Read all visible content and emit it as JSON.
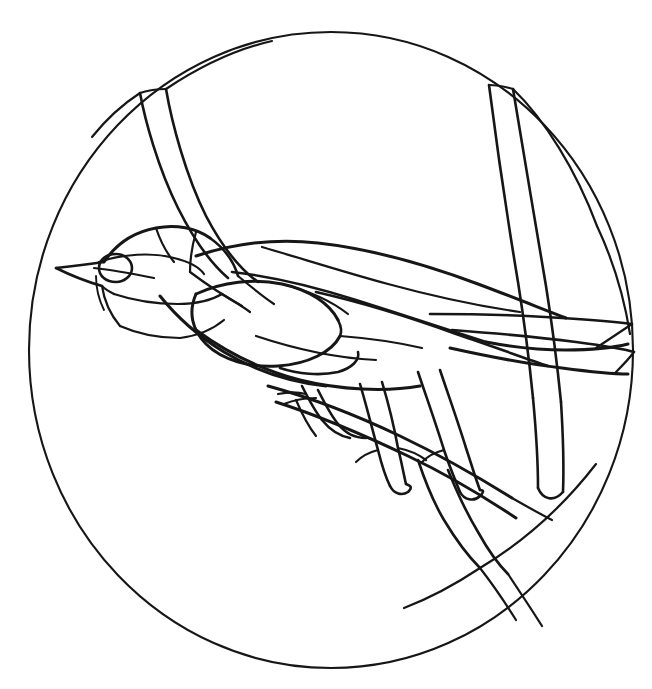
{
  "artwork": {
    "title": "Stained Glass Bird Pattern",
    "subject": "perched songbird on branch inside circular border",
    "style": "line-art / stained-glass lead-came pattern",
    "background_color": "#ffffff",
    "line_color": "#161616",
    "canvas": {
      "width": 652,
      "height": 689
    }
  },
  "frame": {
    "name": "circular-border",
    "shape": "circle",
    "center_x": 331,
    "center_y": 350,
    "radius_x": 302,
    "radius_y": 318,
    "stroke_width": 2.1
  },
  "regions": [
    {
      "name": "head",
      "label": "Head"
    },
    {
      "name": "crown",
      "label": "Crown"
    },
    {
      "name": "eye",
      "label": "Eye"
    },
    {
      "name": "beak",
      "label": "Beak"
    },
    {
      "name": "cheek",
      "label": "Cheek"
    },
    {
      "name": "throat",
      "label": "Throat"
    },
    {
      "name": "breast",
      "label": "Breast"
    },
    {
      "name": "belly",
      "label": "Belly"
    },
    {
      "name": "back",
      "label": "Back"
    },
    {
      "name": "wing-coverts",
      "label": "Wing coverts"
    },
    {
      "name": "wing-primaries",
      "label": "Wing primaries"
    },
    {
      "name": "tail",
      "label": "Tail"
    },
    {
      "name": "leg-front",
      "label": "Front leg"
    },
    {
      "name": "leg-rear",
      "label": "Rear leg"
    },
    {
      "name": "foot-toes",
      "label": "Toes"
    },
    {
      "name": "branch-main",
      "label": "Main branch"
    },
    {
      "name": "branch-upper-left",
      "label": "Upper left branch"
    },
    {
      "name": "branch-upper-right",
      "label": "Upper right branch"
    },
    {
      "name": "branch-lower",
      "label": "Lower branch"
    }
  ],
  "chart_data": {
    "type": "line",
    "xlabel": "",
    "ylabel": "",
    "paths": {
      "frame_circle": "M 331 32 C 497 32 633 174 633 350 C 633 526 497 668 331 668 C 165 668 29 526 29 350 C 29 174 165 32 331 32 Z",
      "branch_ul_edge_a": "M 140 93 C 145 120 158 168 178 208 C 196 244 214 266 228 278",
      "branch_ul_edge_b": "M 166 89 C 172 124 186 176 206 216 C 226 254 244 272 258 282",
      "branch_ul_top": "M 140 93 C 149 90 158 89 166 89",
      "branch_ul_tip_left": "M 140 93 C 120 106 104 122 92 137",
      "branch_ul_tip_right": "M 166 89 C 196 69 232 50 272 41",
      "branch_ur_edge_a": "M 489 85 C 496 140 508 222 518 282 C 525 326 530 368 533 398",
      "branch_ur_edge_b": "M 513 89 C 522 145 536 226 546 286 C 553 330 558 372 561 402",
      "branch_ur_top": "M 489 85 C 497 85 506 87 513 89",
      "branch_ur_tip": "M 513 89 C 545 120 576 170 597 226",
      "branch_ur_low_a": "M 533 398 C 536 430 538 462 538 488",
      "branch_ur_low_b": "M 561 402 C 563 434 564 466 563 492",
      "branch_ur_cap": "M 538 488 C 543 500 554 502 563 492",
      "back_top": "M 196 256 C 236 243 276 238 318 243 C 372 249 430 266 478 284 C 510 296 540 308 566 318",
      "back_seam": "M 262 247 C 300 258 344 272 388 284 C 432 296 478 306 520 312",
      "wing_top_edge": "M 232 272 C 268 276 312 286 356 300 C 400 314 448 330 486 342",
      "wing_primary_a": "M 316 292 C 360 302 412 318 456 334 C 492 346 524 358 548 366",
      "wing_outline": "M 486 342 C 512 347 542 350 566 350 C 590 350 612 348 628 344",
      "tail_top_edge": "M 430 314 C 470 314 520 315 562 318 C 596 320 618 322 632 324",
      "tail_mid_edge": "M 452 330 C 492 333 538 337 576 342 C 606 346 624 349 634 352",
      "tail_lower_edge": "M 450 348 C 486 356 528 364 562 368 C 592 372 614 374 628 374",
      "tail_tip_a": "M 632 324 C 620 332 608 340 596 348",
      "tail_tip_b": "M 634 352 C 628 360 622 366 616 372",
      "belly_line": "M 196 330 C 226 352 262 370 300 380 C 340 390 386 392 420 386",
      "underwing": "M 256 336 C 292 348 334 358 376 360",
      "breast_outline": "M 160 296 C 176 316 198 336 224 352 C 254 370 290 382 326 386",
      "head_crown": "M 104 262 C 116 244 134 232 156 228 C 176 224 196 228 210 238",
      "head_nape": "M 210 238 C 224 248 234 262 238 276",
      "beak_upper": "M 104 262 C 90 264 74 266 56 268",
      "beak_lower": "M 56 268 C 72 276 88 282 102 286",
      "beak_line": "M 102 286 C 106 290 110 292 114 294",
      "gape_line": "M 94 268 C 112 270 134 274 154 278",
      "eye_ring": "M 132 268 C 132 276 124 282 116 282 C 106 282 99 276 99 268 C 99 260 106 254 116 254 C 124 254 132 260 132 268",
      "eye_stripe": "M 99 262 C 122 254 152 252 174 258 C 190 262 200 268 204 274",
      "cheek_a": "M 114 294 C 132 300 156 304 178 304 C 196 304 212 300 222 294",
      "cheek_b": "M 102 286 C 104 300 110 314 120 326",
      "malar": "M 96 276 C 96 288 99 300 104 310",
      "crown_seam": "M 156 228 C 160 240 166 252 174 262",
      "nape_seam": "M 196 232 C 192 246 190 260 190 272",
      "throat_seam": "M 120 326 C 138 334 160 338 180 338",
      "throat_lower": "M 180 338 C 196 336 212 330 224 320",
      "neck_side": "M 222 294 C 232 300 242 306 250 312",
      "shoulder_a": "M 190 272 C 206 284 224 296 242 306",
      "shoulder_b": "M 238 276 C 250 286 262 296 274 304",
      "coverts_upper": "M 196 294 C 222 282 254 278 282 284 C 310 290 330 304 338 320",
      "coverts_lower": "M 196 294 C 188 312 192 330 206 344 C 222 360 250 368 278 366 C 308 364 332 352 340 336",
      "coverts_seam": "M 338 320 C 342 328 342 332 340 336",
      "scapular": "M 282 284 C 306 290 330 300 348 314",
      "flank_patch": "M 280 368 C 298 374 320 376 338 372 C 352 368 360 360 358 352",
      "tertials": "M 340 336 C 366 338 396 342 422 348",
      "leg_front_a": "M 360 384 C 366 404 372 428 378 450 C 382 466 386 478 390 486",
      "leg_front_b": "M 382 382 C 388 402 394 426 398 448 C 402 464 404 476 406 484",
      "leg_front_foot": "M 390 486 C 394 494 402 496 408 492 C 412 488 412 486 406 484",
      "toe_front_a": "M 378 450 C 370 452 362 456 356 462",
      "toe_front_b": "M 398 448 C 408 450 418 454 426 460",
      "leg_rear_a": "M 418 372 C 426 396 436 424 444 450 C 450 468 456 482 460 492",
      "leg_rear_b": "M 440 370 C 448 394 458 422 466 448 C 472 466 476 480 480 490",
      "leg_rear_foot": "M 460 492 C 464 500 474 502 480 496 C 484 492 484 490 480 490",
      "toe_rear": "M 444 450 C 436 452 428 456 422 462",
      "toes_wrap_a": "M 302 386 C 308 398 314 410 322 420 C 330 430 340 436 350 438",
      "toes_wrap_b": "M 318 390 C 324 402 330 414 338 424 C 346 434 356 438 366 438",
      "toes_wrap_c": "M 296 400 C 302 414 308 426 316 436",
      "toe_claw_a": "M 278 394 C 288 392 298 392 306 394",
      "toe_claw_b": "M 284 404 C 294 400 306 398 316 398",
      "branch_main_top": "M 268 386 C 312 398 358 416 400 436 C 442 456 480 478 512 498",
      "branch_main_bot": "M 276 402 C 320 416 366 436 408 456 C 450 476 486 498 516 518",
      "branch_main_right": "M 512 498 C 526 506 540 514 552 520",
      "branch_lower_a": "M 418 460 C 424 478 432 500 444 520 C 456 540 468 556 480 568",
      "branch_lower_b": "M 448 470 C 456 490 466 512 478 532 C 488 550 498 564 508 574",
      "branch_to_rim_a": "M 480 568 C 494 586 506 604 516 620",
      "branch_to_rim_b": "M 508 574 C 520 592 532 610 542 626",
      "rim_chord_right": "M 480 568 C 520 544 562 508 596 464",
      "rim_chord_lower": "M 480 568 C 456 584 430 598 404 608",
      "rim_chord_up_right": "M 597 226 C 612 258 624 296 630 334"
    },
    "stroke_widths": {
      "frame": 2.1,
      "main": 3.0,
      "medium": 2.6,
      "thin": 2.2,
      "hair": 1.9
    },
    "colors": {
      "stroke": "#161616",
      "fill": "none",
      "background": "#ffffff"
    }
  }
}
